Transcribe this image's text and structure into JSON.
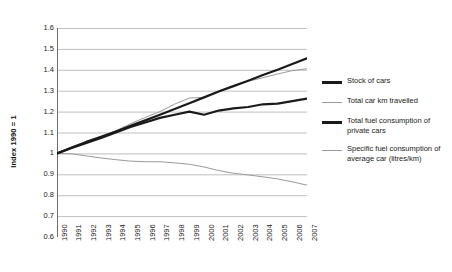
{
  "chart_data": {
    "type": "line",
    "title": "",
    "xlabel": "",
    "ylabel": "Index 1990 = 1",
    "ylim": [
      0.6,
      1.6
    ],
    "yticks": [
      "1.6",
      "1.5",
      "1.4",
      "1.3",
      "1.2",
      "1.1",
      "1",
      "0.9",
      "0.8",
      "0.7",
      "0.6"
    ],
    "grid": true,
    "legend_position": "right",
    "x": [
      1990,
      1991,
      1992,
      1993,
      1994,
      1995,
      1996,
      1997,
      1998,
      1999,
      2000,
      2001,
      2002,
      2003,
      2004,
      2005,
      2006,
      2007
    ],
    "categories": [
      "1990",
      "1991",
      "1992",
      "1993",
      "1994",
      "1995",
      "1996",
      "1997",
      "1998",
      "1999",
      "2000",
      "2001",
      "2002",
      "2003",
      "2004",
      "2005",
      "2006",
      "2007"
    ],
    "series": [
      {
        "name": "Stock of cars",
        "color": "#1a1a1a",
        "width": 2.2,
        "values": [
          1.0,
          1.028,
          1.055,
          1.08,
          1.105,
          1.132,
          1.158,
          1.185,
          1.212,
          1.24,
          1.268,
          1.296,
          1.322,
          1.348,
          1.375,
          1.4,
          1.428,
          1.455
        ]
      },
      {
        "name": "Total car km travelled",
        "color": "#9a9a9a",
        "width": 1.0,
        "values": [
          1.0,
          1.03,
          1.058,
          1.082,
          1.108,
          1.142,
          1.172,
          1.2,
          1.236,
          1.265,
          1.268,
          1.3,
          1.325,
          1.345,
          1.362,
          1.38,
          1.396,
          1.405
        ]
      },
      {
        "name": "Total fuel consumption of private cars",
        "color": "#1a1a1a",
        "width": 2.2,
        "values": [
          1.0,
          1.026,
          1.05,
          1.074,
          1.1,
          1.126,
          1.148,
          1.17,
          1.185,
          1.2,
          1.185,
          1.205,
          1.215,
          1.222,
          1.235,
          1.238,
          1.25,
          1.262
        ]
      },
      {
        "name": "Specific fuel consumption of average car (litres/km)",
        "color": "#9a9a9a",
        "width": 1.0,
        "values": [
          1.0,
          0.998,
          0.988,
          0.978,
          0.97,
          0.963,
          0.96,
          0.96,
          0.955,
          0.948,
          0.935,
          0.918,
          0.905,
          0.897,
          0.888,
          0.878,
          0.864,
          0.848
        ]
      }
    ]
  },
  "legend": {
    "items": [
      {
        "label": "Stock of cars",
        "style": "thick"
      },
      {
        "label": "Total car km travelled",
        "style": "thin"
      },
      {
        "label": "Total fuel consumption of private cars",
        "style": "thick"
      },
      {
        "label": "Specific fuel consumption of average car (litres/km)",
        "style": "thin"
      }
    ]
  },
  "colors": {
    "series_dark": "#1a1a1a",
    "series_light": "#9a9a9a",
    "grid": "#aeaeae",
    "axis": "#6d6d6d",
    "background": "#ffffff"
  }
}
